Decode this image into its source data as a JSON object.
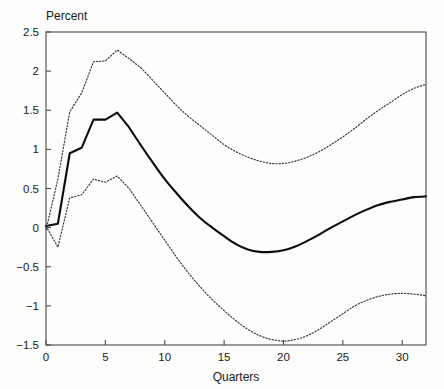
{
  "chart_data": {
    "type": "line",
    "title": "",
    "xlabel": "Quarters",
    "ylabel": "Percent",
    "ylabel_position": "top-left",
    "xlim": [
      0,
      32
    ],
    "ylim": [
      -1.5,
      2.5
    ],
    "xticks": [
      0,
      5,
      10,
      15,
      20,
      25,
      30
    ],
    "xtick_labels": [
      "0",
      "5",
      "10",
      "15",
      "20",
      "25",
      "30"
    ],
    "yticks": [
      -1.5,
      -1,
      -0.5,
      0,
      0.5,
      1,
      1.5,
      2,
      2.5
    ],
    "ytick_labels": [
      "-1.5",
      "-1",
      "-0.5",
      "0",
      "0.5",
      "1",
      "1.5",
      "2",
      "2.5"
    ],
    "grid": false,
    "legend": null,
    "x": [
      0,
      1,
      2,
      3,
      4,
      5,
      6,
      7,
      8,
      9,
      10,
      11,
      12,
      13,
      14,
      15,
      16,
      17,
      18,
      19,
      20,
      21,
      22,
      23,
      24,
      25,
      26,
      27,
      28,
      29,
      30,
      31,
      32
    ],
    "series": [
      {
        "name": "point-estimate",
        "style": "solid",
        "color": "#0b0b0b",
        "values": [
          0.02,
          0.05,
          0.95,
          1.02,
          1.38,
          1.38,
          1.47,
          1.28,
          1.05,
          0.83,
          0.62,
          0.44,
          0.27,
          0.12,
          0.0,
          -0.11,
          -0.21,
          -0.28,
          -0.31,
          -0.31,
          -0.29,
          -0.24,
          -0.17,
          -0.09,
          0.0,
          0.08,
          0.16,
          0.23,
          0.29,
          0.33,
          0.36,
          0.39,
          0.4
        ]
      },
      {
        "name": "upper-confidence-band",
        "style": "dotted",
        "color": "#333333",
        "values": [
          -0.03,
          0.62,
          1.48,
          1.72,
          2.12,
          2.13,
          2.27,
          2.16,
          2.04,
          1.88,
          1.72,
          1.56,
          1.42,
          1.3,
          1.18,
          1.06,
          0.97,
          0.9,
          0.85,
          0.82,
          0.82,
          0.85,
          0.9,
          0.97,
          1.06,
          1.16,
          1.27,
          1.39,
          1.5,
          1.6,
          1.7,
          1.78,
          1.83
        ]
      },
      {
        "name": "lower-confidence-band",
        "style": "dotted",
        "color": "#333333",
        "values": [
          0.02,
          -0.25,
          0.38,
          0.42,
          0.62,
          0.58,
          0.66,
          0.5,
          0.28,
          0.06,
          -0.16,
          -0.38,
          -0.58,
          -0.76,
          -0.92,
          -1.06,
          -1.19,
          -1.3,
          -1.38,
          -1.43,
          -1.45,
          -1.43,
          -1.38,
          -1.3,
          -1.2,
          -1.1,
          -1.0,
          -0.93,
          -0.88,
          -0.85,
          -0.84,
          -0.85,
          -0.87
        ]
      }
    ]
  }
}
